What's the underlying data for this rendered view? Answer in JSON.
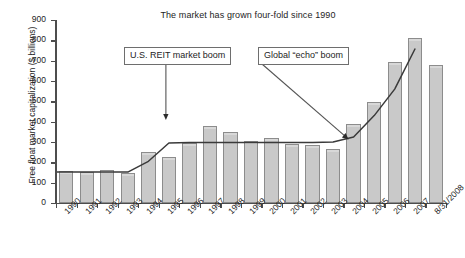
{
  "chart_data": {
    "type": "bar",
    "title": "The market has grown four-fold since 1990",
    "xlabel": "",
    "ylabel": "Free float market capitalization ($ billions)",
    "ylim": [
      0,
      900
    ],
    "ytick_labels": [
      "900",
      "800",
      "700",
      "600",
      "500",
      "400",
      "300",
      "200",
      "100",
      "0"
    ],
    "ytick_values": [
      900,
      800,
      700,
      600,
      500,
      400,
      300,
      200,
      100,
      0
    ],
    "grid": false,
    "legend": "none",
    "categories": [
      "1990",
      "1991",
      "1992",
      "1993",
      "1994",
      "1995",
      "1996",
      "1997",
      "1998",
      "1999",
      "2000",
      "2001",
      "2002",
      "2003",
      "2004",
      "2005",
      "2006",
      "2007",
      "8/31/2008"
    ],
    "series": [
      {
        "name": "Free float market capitalization",
        "type": "bar",
        "values": [
          158,
          153,
          160,
          146,
          250,
          228,
          295,
          377,
          348,
          303,
          318,
          292,
          287,
          265,
          388,
          495,
          695,
          812,
          678
        ]
      },
      {
        "name": "Trend line",
        "type": "line",
        "values": [
          152,
          152,
          152,
          152,
          205,
          295,
          297,
          297,
          297,
          297,
          297,
          297,
          297,
          300,
          325,
          430,
          560,
          760,
          null
        ]
      }
    ],
    "annotations": [
      {
        "name": "U.S. REIT market boom",
        "label": "U.S. REIT market boom",
        "points_to_category": "1995",
        "points_to_value": 425,
        "arrow": "down"
      },
      {
        "name": "Global “echo” boom",
        "label": "Global “echo” boom",
        "points_to_category": "2004",
        "points_to_value": 320,
        "arrow": "diagonal-down-right"
      }
    ],
    "colors": {
      "bar_fill": "#c9c9c9",
      "bar_border": "#8c8c8c",
      "axis": "#4d4d4d",
      "text": "#242424",
      "trend_line": "#3a3a3a",
      "callout_border": "#6e6e6e",
      "background": "#ffffff"
    }
  }
}
